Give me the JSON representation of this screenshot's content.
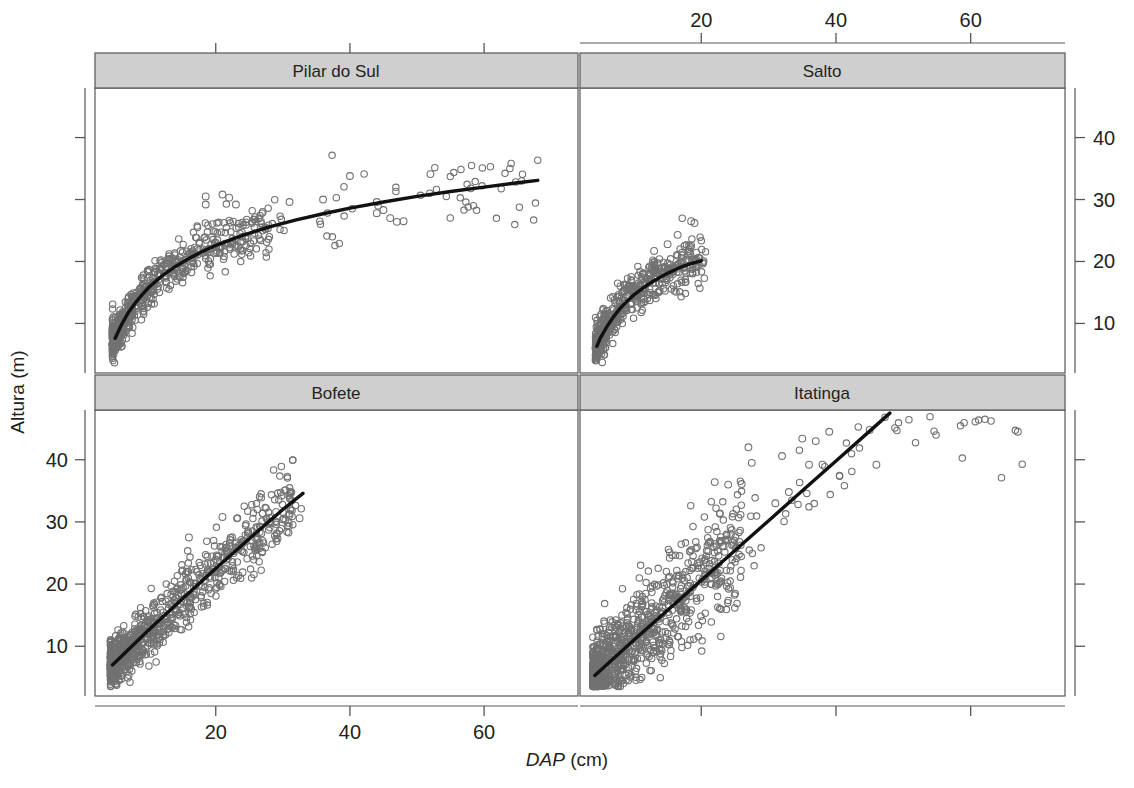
{
  "chart_data": {
    "type": "scatter",
    "title": "",
    "xlabel": "DAP (cm)",
    "xlabel_italic_part": "DAP",
    "xlabel_plain_part": "(cm)",
    "ylabel": "Altura (m)",
    "layout": "trellis 2x2, shared axes, alternating tick sides",
    "grid": false,
    "legend": "none",
    "xlim": [
      2,
      74
    ],
    "ylim": [
      2,
      48
    ],
    "xticks": [
      20,
      40,
      60
    ],
    "yticks": [
      10,
      20,
      30,
      40
    ],
    "xtick_labels": [
      "20",
      "40",
      "60"
    ],
    "ytick_labels": [
      "10",
      "20",
      "30",
      "40"
    ],
    "marker": "open-circle",
    "marker_color": "#6e6e6e",
    "fit_line_color": "#0d0d0d",
    "strip_fill": "#cfcfcf",
    "panel_border": "#555555",
    "panels": [
      {
        "name": "Pilar do Sul",
        "position": "top-left",
        "xaxis_side": "top",
        "yaxis_side": "left",
        "fit": "saturating curve (logarithmic / Chapman-Richards)",
        "fit_points": [
          [
            5.0,
            7.6
          ],
          [
            6,
            9.9
          ],
          [
            7,
            11.8
          ],
          [
            8,
            13.3
          ],
          [
            9,
            14.6
          ],
          [
            10,
            15.8
          ],
          [
            12,
            17.7
          ],
          [
            14,
            19.2
          ],
          [
            16,
            20.5
          ],
          [
            18,
            21.6
          ],
          [
            20,
            22.6
          ],
          [
            24,
            24.2
          ],
          [
            28,
            25.6
          ],
          [
            32,
            26.7
          ],
          [
            36,
            27.7
          ],
          [
            40,
            28.6
          ],
          [
            45,
            29.6
          ],
          [
            50,
            30.5
          ],
          [
            55,
            31.3
          ],
          [
            60,
            32.0
          ],
          [
            65,
            32.7
          ],
          [
            68,
            33.1
          ]
        ],
        "x_range": [
          4.5,
          68
        ],
        "y_range": [
          4.5,
          35
        ],
        "n_points_approx": 600,
        "cloud": {
          "x_dense": [
            4.5,
            28
          ],
          "y_at_xmin": [
            5,
            9
          ],
          "y_at_xdense_max": [
            20,
            28
          ]
        },
        "outliers": [
          [
            18.5,
            30.5
          ],
          [
            18.5,
            29.2
          ],
          [
            21,
            30.8
          ],
          [
            22,
            30.3
          ],
          [
            23,
            29.2
          ],
          [
            27,
            28.0
          ],
          [
            31,
            29.6
          ],
          [
            36,
            30.0
          ],
          [
            40,
            33.8
          ],
          [
            44,
            29.6
          ],
          [
            44,
            27.8
          ],
          [
            45,
            28.3
          ],
          [
            46,
            27.0
          ],
          [
            47,
            26.4
          ],
          [
            48,
            26.5
          ],
          [
            52,
            34.1
          ],
          [
            58,
            31.8
          ]
        ]
      },
      {
        "name": "Salto",
        "position": "top-right",
        "xaxis_side": "top",
        "yaxis_side": "right",
        "fit": "slightly concave curve",
        "fit_points": [
          [
            4.5,
            6.3
          ],
          [
            5,
            7.6
          ],
          [
            6,
            9.5
          ],
          [
            7,
            11.1
          ],
          [
            8,
            12.5
          ],
          [
            9,
            13.6
          ],
          [
            10,
            14.6
          ],
          [
            11,
            15.4
          ],
          [
            12,
            16.2
          ],
          [
            13,
            16.9
          ],
          [
            14,
            17.5
          ],
          [
            15,
            18.1
          ],
          [
            16,
            18.6
          ],
          [
            17,
            19.1
          ],
          [
            18,
            19.5
          ],
          [
            19,
            19.8
          ],
          [
            20,
            20.1
          ]
        ],
        "x_range": [
          4.2,
          21
        ],
        "y_range": [
          4.5,
          27
        ],
        "n_points_approx": 500,
        "outliers": [
          [
            18.5,
            26.5
          ],
          [
            19,
            26.2
          ],
          [
            16.5,
            24.3
          ],
          [
            17.5,
            22.5
          ],
          [
            15,
            22.8
          ],
          [
            18.5,
            22.6
          ],
          [
            13,
            21.7
          ]
        ]
      },
      {
        "name": "Bofete",
        "position": "bottom-left",
        "xaxis_side": "bottom",
        "yaxis_side": "left",
        "fit": "near-linear",
        "fit_points": [
          [
            4.6,
            7.0
          ],
          [
            10,
            12.6
          ],
          [
            15,
            17.6
          ],
          [
            20,
            22.5
          ],
          [
            25,
            27.3
          ],
          [
            30,
            32.0
          ],
          [
            33,
            34.6
          ]
        ],
        "x_range": [
          4.2,
          33
        ],
        "y_range": [
          4.5,
          32
        ],
        "n_points_approx": 900,
        "outliers": [
          [
            21,
            30.8
          ],
          [
            27,
            31.4
          ],
          [
            29,
            31.6
          ],
          [
            31,
            31.1
          ],
          [
            32.5,
            30.6
          ],
          [
            24,
            21.9
          ],
          [
            16,
            27.5
          ]
        ]
      },
      {
        "name": "Itatinga",
        "position": "bottom-right",
        "xaxis_side": "bottom",
        "yaxis_side": "right",
        "fit": "linear steep",
        "fit_points": [
          [
            4.2,
            5.3
          ],
          [
            10,
            11.0
          ],
          [
            15,
            15.8
          ],
          [
            20,
            20.6
          ],
          [
            25,
            25.4
          ],
          [
            30,
            30.2
          ],
          [
            35,
            35.0
          ],
          [
            40,
            39.8
          ],
          [
            45,
            44.6
          ],
          [
            48,
            47.5
          ]
        ],
        "x_range": [
          3.8,
          68
        ],
        "y_range": [
          3.5,
          46
        ],
        "n_points_approx": 950,
        "outliers": [
          [
            27,
            42.0
          ],
          [
            27.5,
            39.5
          ],
          [
            32,
            40.6
          ],
          [
            35,
            43.4
          ],
          [
            37,
            43.0
          ],
          [
            39,
            44.5
          ],
          [
            36,
            39.2
          ],
          [
            38,
            39.2
          ],
          [
            45,
            44.8
          ],
          [
            46,
            39.2
          ],
          [
            67,
            44.5
          ],
          [
            31,
            33.0
          ],
          [
            24,
            36.0
          ],
          [
            26,
            36.1
          ],
          [
            22,
            36.4
          ],
          [
            33,
            34.8
          ]
        ]
      }
    ]
  },
  "figure": {
    "strip_titles": [
      "Pilar do Sul",
      "Salto",
      "Bofete",
      "Itatinga"
    ],
    "top_axis_ticks": [
      "20",
      "40",
      "60"
    ],
    "bottom_axis_ticks": [
      "20",
      "40",
      "60"
    ],
    "left_axis_ticks": [
      "40",
      "30",
      "20",
      "10"
    ],
    "right_axis_ticks": [
      "40",
      "30",
      "20",
      "10"
    ],
    "x_axis_title_italic": "DAP",
    "x_axis_title_rest": " (cm)",
    "y_axis_title": "Altura (m)",
    "colors": {
      "strip_background": "#cfcfcf",
      "panel_border": "#565656",
      "marker_stroke": "#727272",
      "fit_line": "#111111",
      "text": "#231f20",
      "page_background": "#ffffff"
    }
  }
}
